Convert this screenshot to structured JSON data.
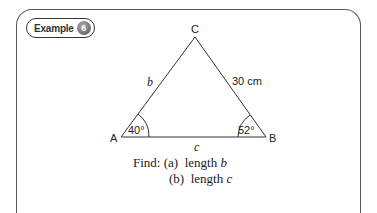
{
  "badge": {
    "label": "Example",
    "number": "6"
  },
  "triangle": {
    "vertices": {
      "A": "A",
      "B": "B",
      "C": "C"
    },
    "sides": {
      "b": "b",
      "a": "30 cm",
      "c": "c"
    },
    "angles": {
      "A": "40°",
      "B": "52°"
    }
  },
  "question": {
    "prefix": "Find:",
    "parts": [
      {
        "label": "(a)",
        "text": "length",
        "var": "b"
      },
      {
        "label": "(b)",
        "text": "length",
        "var": "c"
      }
    ]
  }
}
